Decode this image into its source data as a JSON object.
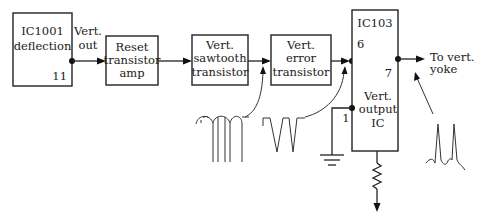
{
  "diagram": {
    "type": "block-diagram",
    "blocks": [
      {
        "id": "ic1001",
        "lines": [
          "IC1001",
          "deflection"
        ],
        "pin": "11"
      },
      {
        "id": "reset",
        "lines": [
          "Reset",
          "transistor",
          "amp"
        ]
      },
      {
        "id": "sawtooth",
        "lines": [
          "Vert.",
          "sawtooth",
          "transistor"
        ]
      },
      {
        "id": "error",
        "lines": [
          "Vert.",
          "error",
          "transistor"
        ]
      },
      {
        "id": "ic103",
        "title": "IC103",
        "lines": [
          "Vert.",
          "output",
          "IC"
        ],
        "pins": {
          "input": "6",
          "output": "7",
          "ground": "1"
        }
      }
    ],
    "labels": {
      "vert_out": [
        "Vert.",
        "out"
      ],
      "to_yoke": [
        "To vert.",
        "yoke"
      ]
    },
    "waveforms": [
      {
        "id": "wave-sawtooth-input",
        "shape": "looped pulses"
      },
      {
        "id": "wave-error-input",
        "shape": "negative pulses"
      },
      {
        "id": "wave-yoke-output",
        "shape": "positive spikes"
      }
    ],
    "colors": {
      "line": "#222222",
      "background": "#ffffff"
    }
  }
}
